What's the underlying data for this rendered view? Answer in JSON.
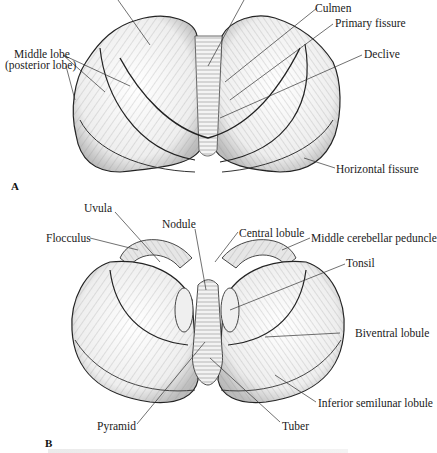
{
  "figure": {
    "panels": [
      {
        "id": "A",
        "view": "superior",
        "label": "A",
        "annotations": [
          {
            "key": "culmen",
            "text": "Culmen"
          },
          {
            "key": "primary_fissure",
            "text": "Primary fissure"
          },
          {
            "key": "declive",
            "text": "Declive"
          },
          {
            "key": "middle_lobe",
            "text": "Middle lobe"
          },
          {
            "key": "middle_lobe_sub",
            "text": "(posterior lobe)"
          },
          {
            "key": "horizontal_fissure",
            "text": "Horizontal fissure"
          }
        ]
      },
      {
        "id": "B",
        "view": "inferior",
        "label": "B",
        "annotations": [
          {
            "key": "uvula",
            "text": "Uvula"
          },
          {
            "key": "nodule",
            "text": "Nodule"
          },
          {
            "key": "flocculus",
            "text": "Flocculus"
          },
          {
            "key": "central_lobule",
            "text": "Central lobule"
          },
          {
            "key": "middle_cerebellar_peduncle",
            "text": "Middle cerebellar peduncle"
          },
          {
            "key": "tonsil",
            "text": "Tonsil"
          },
          {
            "key": "biventral_lobule",
            "text": "Biventral lobule"
          },
          {
            "key": "inferior_semilunar_lobule",
            "text": "Inferior semilunar lobule"
          },
          {
            "key": "pyramid",
            "text": "Pyramid"
          },
          {
            "key": "tuber",
            "text": "Tuber"
          }
        ]
      }
    ],
    "colors": {
      "ink": "#1a1a1a",
      "shade": "#bdbdbd",
      "paper": "#ffffff"
    }
  }
}
